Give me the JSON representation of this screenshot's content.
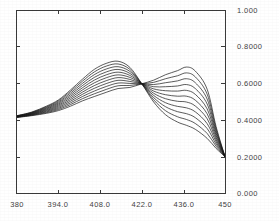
{
  "chart_data": {
    "type": "line",
    "title": "",
    "subtitle": "",
    "xlabel": "",
    "ylabel": "",
    "xlim": [
      380,
      450
    ],
    "ylim": [
      0.0,
      1.0
    ],
    "grid": false,
    "legend": "none",
    "x_ticks": [
      380,
      394.0,
      408.0,
      422.0,
      436.0,
      450
    ],
    "x_tick_labels": [
      "380",
      "394.0",
      "408.0",
      "422.0",
      "436.0",
      "450"
    ],
    "y_ticks": [
      0.0,
      0.2,
      0.4,
      0.6,
      0.8,
      1.0
    ],
    "y_tick_labels": [
      "0.000",
      "0.2000",
      "0.4000",
      "0.6000",
      "0.8000",
      "1.000"
    ],
    "y_axis_position": "right",
    "x_axis_position": "bottom",
    "line_color": "#151515",
    "line_width": 0.7,
    "frame_color": "#3a3a3a",
    "background_color": "#ffffff",
    "isosbestic_point": {
      "x": 422.0,
      "y": 0.6
    },
    "x": [
      380,
      385,
      390,
      394,
      398,
      402,
      406,
      410,
      414,
      418,
      422,
      426,
      430,
      434,
      437,
      440,
      444,
      447,
      450
    ],
    "series": [
      {
        "name": "spectrum 1",
        "values": [
          0.425,
          0.445,
          0.478,
          0.512,
          0.566,
          0.625,
          0.679,
          0.712,
          0.724,
          0.69,
          0.6,
          0.5,
          0.43,
          0.39,
          0.372,
          0.35,
          0.3,
          0.245,
          0.2
        ]
      },
      {
        "name": "spectrum 2",
        "values": [
          0.424,
          0.443,
          0.474,
          0.507,
          0.558,
          0.614,
          0.665,
          0.697,
          0.709,
          0.679,
          0.6,
          0.512,
          0.452,
          0.419,
          0.404,
          0.382,
          0.327,
          0.257,
          0.2
        ]
      },
      {
        "name": "spectrum 3",
        "values": [
          0.423,
          0.441,
          0.47,
          0.501,
          0.549,
          0.602,
          0.65,
          0.681,
          0.694,
          0.668,
          0.6,
          0.524,
          0.474,
          0.447,
          0.436,
          0.414,
          0.354,
          0.269,
          0.2
        ]
      },
      {
        "name": "spectrum 4",
        "values": [
          0.422,
          0.439,
          0.466,
          0.495,
          0.54,
          0.59,
          0.635,
          0.665,
          0.679,
          0.657,
          0.6,
          0.536,
          0.496,
          0.476,
          0.468,
          0.446,
          0.381,
          0.281,
          0.2
        ]
      },
      {
        "name": "spectrum 5",
        "values": [
          0.421,
          0.437,
          0.462,
          0.489,
          0.531,
          0.578,
          0.62,
          0.649,
          0.664,
          0.646,
          0.6,
          0.548,
          0.518,
          0.504,
          0.5,
          0.478,
          0.408,
          0.293,
          0.2
        ]
      },
      {
        "name": "spectrum 6",
        "values": [
          0.42,
          0.435,
          0.458,
          0.483,
          0.522,
          0.566,
          0.605,
          0.633,
          0.649,
          0.635,
          0.6,
          0.56,
          0.54,
          0.532,
          0.532,
          0.51,
          0.435,
          0.305,
          0.2
        ]
      },
      {
        "name": "spectrum 7",
        "values": [
          0.419,
          0.433,
          0.454,
          0.477,
          0.513,
          0.554,
          0.59,
          0.617,
          0.634,
          0.624,
          0.6,
          0.572,
          0.562,
          0.56,
          0.564,
          0.542,
          0.462,
          0.317,
          0.2
        ]
      },
      {
        "name": "spectrum 8",
        "values": [
          0.418,
          0.431,
          0.45,
          0.471,
          0.504,
          0.542,
          0.575,
          0.601,
          0.619,
          0.613,
          0.6,
          0.584,
          0.584,
          0.588,
          0.596,
          0.574,
          0.489,
          0.329,
          0.2
        ]
      },
      {
        "name": "spectrum 9",
        "values": [
          0.417,
          0.429,
          0.446,
          0.465,
          0.495,
          0.53,
          0.56,
          0.585,
          0.604,
          0.602,
          0.6,
          0.596,
          0.606,
          0.616,
          0.628,
          0.606,
          0.516,
          0.341,
          0.2
        ]
      },
      {
        "name": "spectrum 10",
        "values": [
          0.416,
          0.427,
          0.442,
          0.459,
          0.486,
          0.518,
          0.545,
          0.569,
          0.589,
          0.591,
          0.6,
          0.608,
          0.628,
          0.644,
          0.66,
          0.638,
          0.543,
          0.353,
          0.2
        ]
      },
      {
        "name": "spectrum 11",
        "values": [
          0.415,
          0.425,
          0.438,
          0.453,
          0.477,
          0.506,
          0.53,
          0.553,
          0.574,
          0.58,
          0.6,
          0.62,
          0.65,
          0.672,
          0.692,
          0.67,
          0.57,
          0.365,
          0.2
        ]
      }
    ]
  }
}
